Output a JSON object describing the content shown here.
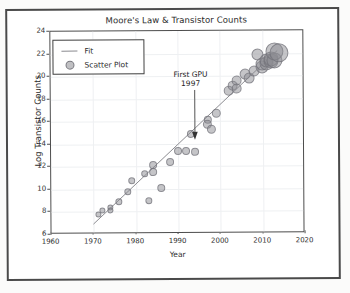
{
  "chart_data": {
    "type": "scatter",
    "title": "Moore's Law & Transistor Counts",
    "xlabel": "Year",
    "ylabel": "Log Transistor Counts",
    "xlim": [
      1960,
      2020
    ],
    "ylim": [
      6,
      24
    ],
    "xticks": [
      1960,
      1970,
      1980,
      1990,
      2000,
      2010,
      2020
    ],
    "yticks": [
      6,
      8,
      10,
      12,
      14,
      16,
      18,
      20,
      22,
      24
    ],
    "grid": true,
    "legend_position": "upper left",
    "legend": [
      {
        "label": "Fit",
        "kind": "line"
      },
      {
        "label": "Scatter Plot",
        "kind": "marker"
      }
    ],
    "annotations": [
      {
        "text_line1": "First GPU",
        "text_line2": "1997",
        "x": 1997,
        "y": 16.1
      }
    ],
    "series": [
      {
        "name": "Scatter Plot",
        "marker_color": "#8c8c91",
        "points": [
          {
            "x": 1971,
            "y": 7.75,
            "size": 3
          },
          {
            "x": 1972,
            "y": 8.15,
            "size": 3
          },
          {
            "x": 1974,
            "y": 8.4,
            "size": 3
          },
          {
            "x": 1974,
            "y": 8.15,
            "size": 3
          },
          {
            "x": 1976,
            "y": 8.9,
            "size": 3.5
          },
          {
            "x": 1978,
            "y": 9.8,
            "size": 3.5
          },
          {
            "x": 1979,
            "y": 10.75,
            "size": 3.5
          },
          {
            "x": 1982,
            "y": 11.4,
            "size": 3.5
          },
          {
            "x": 1983,
            "y": 9.0,
            "size": 3.5
          },
          {
            "x": 1984,
            "y": 12.15,
            "size": 4
          },
          {
            "x": 1984,
            "y": 11.5,
            "size": 4
          },
          {
            "x": 1986,
            "y": 10.05,
            "size": 4
          },
          {
            "x": 1988,
            "y": 12.35,
            "size": 4
          },
          {
            "x": 1990,
            "y": 13.4,
            "size": 4
          },
          {
            "x": 1992,
            "y": 13.4,
            "size": 4
          },
          {
            "x": 1994,
            "y": 13.25,
            "size": 4
          },
          {
            "x": 1993,
            "y": 14.85,
            "size": 4
          },
          {
            "x": 1997,
            "y": 16.1,
            "size": 4
          },
          {
            "x": 1997,
            "y": 15.75,
            "size": 4.5
          },
          {
            "x": 1998,
            "y": 15.25,
            "size": 4.5
          },
          {
            "x": 1999,
            "y": 16.7,
            "size": 4.5
          },
          {
            "x": 2002,
            "y": 18.65,
            "size": 5
          },
          {
            "x": 2003,
            "y": 19.1,
            "size": 5
          },
          {
            "x": 2004,
            "y": 19.6,
            "size": 5
          },
          {
            "x": 2004,
            "y": 18.9,
            "size": 5
          },
          {
            "x": 2006,
            "y": 20.15,
            "size": 5.5
          },
          {
            "x": 2007,
            "y": 19.8,
            "size": 5.5
          },
          {
            "x": 2008,
            "y": 20.45,
            "size": 5.5
          },
          {
            "x": 2009,
            "y": 21.9,
            "size": 6
          },
          {
            "x": 2010,
            "y": 20.8,
            "size": 6.5
          },
          {
            "x": 2010,
            "y": 21.05,
            "size": 6.5
          },
          {
            "x": 2011,
            "y": 21.1,
            "size": 7
          },
          {
            "x": 2011,
            "y": 21.3,
            "size": 7
          },
          {
            "x": 2012,
            "y": 21.3,
            "size": 7.5
          },
          {
            "x": 2012,
            "y": 21.5,
            "size": 7.5
          },
          {
            "x": 2013,
            "y": 21.35,
            "size": 8
          },
          {
            "x": 2013,
            "y": 22.1,
            "size": 9
          },
          {
            "x": 2014,
            "y": 22.0,
            "size": 9.5
          }
        ]
      },
      {
        "name": "Fit",
        "kind": "line",
        "color": "#8a8a8f",
        "x": [
          1970,
          2014
        ],
        "y": [
          6.75,
          22.2
        ]
      }
    ]
  }
}
